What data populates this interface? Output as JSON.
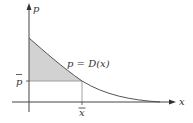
{
  "diagram": {
    "type": "consumer-surplus-demand-curve",
    "axes": {
      "y_label": "p",
      "x_label": "x"
    },
    "curve_label": "p = D(x)",
    "curve_label_parts": {
      "var": "p",
      "eq": " = ",
      "fn": "D(x)"
    },
    "markers": {
      "p_bar": "p",
      "x_bar": "x"
    },
    "shaded_region": "area under demand curve above p̄ from 0 to x̄",
    "colors": {
      "axis": "#444444",
      "curve": "#555555",
      "shade": "#d2d2d2",
      "guide": "#777777",
      "text": "#333333"
    }
  }
}
